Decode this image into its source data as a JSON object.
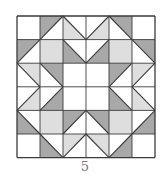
{
  "figure": {
    "caption": "5",
    "grid": {
      "rows": 6,
      "cols": 6,
      "origin_x": 16,
      "origin_y": 15,
      "cell_w": 23,
      "cell_h": 23.6
    },
    "colors": {
      "white": "#ffffff",
      "dark": "#a8a8a8",
      "light": "#dedede",
      "line": "#3a3a3a"
    },
    "cells": [
      [
        {
          "t": "W"
        },
        {
          "t": "/",
          "c": "tl",
          "f": "dark"
        },
        {
          "t": "\\",
          "c": "bl",
          "f": "light"
        },
        {
          "t": "/",
          "c": "br",
          "f": "light"
        },
        {
          "t": "\\",
          "c": "tr",
          "f": "dark"
        },
        {
          "t": "W"
        }
      ],
      [
        {
          "t": "/",
          "c": "tl",
          "f": "dark"
        },
        {
          "t": "F",
          "f": "light"
        },
        {
          "t": "\\",
          "c": "bl",
          "f": "dark"
        },
        {
          "t": "/",
          "c": "br",
          "f": "dark"
        },
        {
          "t": "F",
          "f": "light"
        },
        {
          "t": "\\",
          "c": "tr",
          "f": "dark"
        }
      ],
      [
        {
          "t": "\\",
          "c": "tr",
          "f": "light"
        },
        {
          "t": "\\",
          "c": "tr",
          "f": "dark"
        },
        {
          "t": "W"
        },
        {
          "t": "W"
        },
        {
          "t": "/",
          "c": "tl",
          "f": "dark"
        },
        {
          "t": "/",
          "c": "tl",
          "f": "light"
        }
      ],
      [
        {
          "t": "/",
          "c": "br",
          "f": "light"
        },
        {
          "t": "/",
          "c": "br",
          "f": "dark"
        },
        {
          "t": "W"
        },
        {
          "t": "W"
        },
        {
          "t": "\\",
          "c": "bl",
          "f": "dark"
        },
        {
          "t": "\\",
          "c": "bl",
          "f": "light"
        }
      ],
      [
        {
          "t": "\\",
          "c": "bl",
          "f": "dark"
        },
        {
          "t": "F",
          "f": "light"
        },
        {
          "t": "/",
          "c": "tl",
          "f": "dark"
        },
        {
          "t": "\\",
          "c": "tr",
          "f": "dark"
        },
        {
          "t": "F",
          "f": "light"
        },
        {
          "t": "/",
          "c": "br",
          "f": "dark"
        }
      ],
      [
        {
          "t": "W"
        },
        {
          "t": "\\",
          "c": "bl",
          "f": "dark"
        },
        {
          "t": "/",
          "c": "tl",
          "f": "light"
        },
        {
          "t": "\\",
          "c": "tr",
          "f": "light"
        },
        {
          "t": "/",
          "c": "br",
          "f": "dark"
        },
        {
          "t": "W"
        }
      ]
    ]
  }
}
